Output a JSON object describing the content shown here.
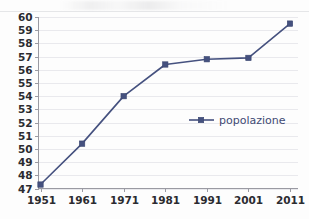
{
  "chart_data": {
    "type": "line",
    "title": "",
    "subtitle": "",
    "xlabel": "",
    "ylabel": "",
    "categories": [
      "1951",
      "1961",
      "1971",
      "1981",
      "1991",
      "2001",
      "2011"
    ],
    "x": [
      1951,
      1961,
      1971,
      1981,
      1991,
      2001,
      2011
    ],
    "series": [
      {
        "name": "popolazione",
        "values": [
          47.3,
          50.4,
          54.0,
          56.4,
          56.8,
          56.9,
          59.5
        ],
        "color": "#45517f",
        "marker": "square"
      }
    ],
    "ylim": [
      47,
      60
    ],
    "yticks": [
      47,
      48,
      49,
      50,
      51,
      52,
      53,
      54,
      55,
      56,
      57,
      58,
      59,
      60
    ],
    "ytick_labels": [
      "47",
      "48",
      "49",
      "50",
      "51",
      "52",
      "53",
      "54",
      "55",
      "56",
      "57",
      "58",
      "59",
      "60"
    ],
    "xtick_labels": [
      "1951",
      "1961",
      "1971",
      "1981",
      "1991",
      "2001",
      "2011"
    ],
    "grid": true,
    "grid_axis": "y",
    "legend": {
      "entries": [
        "popolazione"
      ],
      "position": "center-right",
      "inside_plot": true
    },
    "annotations": []
  },
  "legend": {
    "series_label": "popolazione"
  },
  "colors": {
    "series": "#45517f",
    "gridline": "#e9e9ed",
    "axis": "#9a9aa2",
    "tick_text": "#2b2b30",
    "legend_text": "#3f4a74",
    "background": "#fdfdfd"
  }
}
